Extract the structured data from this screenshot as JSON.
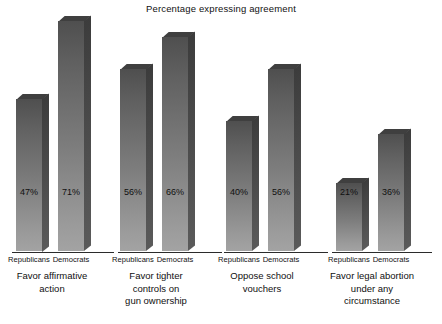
{
  "chart_data": {
    "type": "bar",
    "title": "Percentage expressing agreement",
    "xlabel": "",
    "ylabel": "",
    "ylim": [
      0,
      75
    ],
    "grid": false,
    "legend": "none",
    "value_suffix": "%",
    "categories": [
      "Favor affirmative action",
      "Favor tighter controls on gun ownership",
      "Oppose school vouchers",
      "Favor legal abortion under any circumstance"
    ],
    "series": [
      {
        "name": "Republicans",
        "values": [
          47,
          56,
          40,
          21
        ]
      },
      {
        "name": "Democrats",
        "values": [
          71,
          66,
          56,
          36
        ]
      }
    ],
    "groups": [
      {
        "category_lines": [
          "Favor affirmative",
          "action"
        ],
        "bars": [
          {
            "series": "Republicans",
            "value": 47,
            "label": "47%"
          },
          {
            "series": "Democrats",
            "value": 71,
            "label": "71%"
          }
        ]
      },
      {
        "category_lines": [
          "Favor tighter",
          "controls on",
          "gun ownership"
        ],
        "bars": [
          {
            "series": "Republicans",
            "value": 56,
            "label": "56%"
          },
          {
            "series": "Democrats",
            "value": 66,
            "label": "66%"
          }
        ]
      },
      {
        "category_lines": [
          "Oppose school",
          "vouchers"
        ],
        "bars": [
          {
            "series": "Republicans",
            "value": 40,
            "label": "40%"
          },
          {
            "series": "Democrats",
            "value": 56,
            "label": "56%"
          }
        ]
      },
      {
        "category_lines": [
          "Favor legal abortion",
          "under any",
          "circumstance"
        ],
        "bars": [
          {
            "series": "Republicans",
            "value": 21,
            "label": "21%"
          },
          {
            "series": "Democrats",
            "value": 36,
            "label": "36%"
          }
        ]
      }
    ],
    "colors": {
      "background": "#ffffff",
      "bar_front_top": "#4f4f4f",
      "bar_front_bottom": "#a3a3a3",
      "bar_side": "#474747",
      "bar_top": "#3f3f3f",
      "axis": "#2b2b2b",
      "text": "#101010"
    }
  }
}
